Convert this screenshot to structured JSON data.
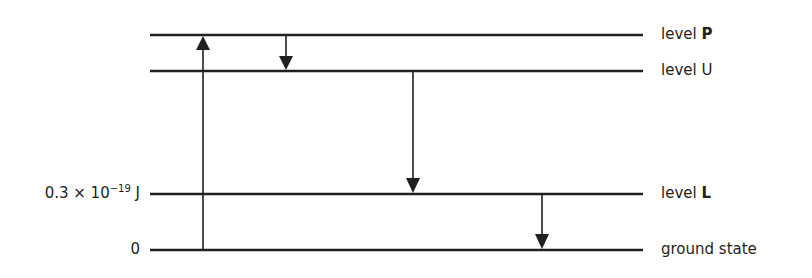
{
  "diagram": {
    "levels": [
      {
        "id": "P",
        "prefix": "level ",
        "name": "P",
        "bold": true,
        "y": 35
      },
      {
        "id": "U",
        "prefix": "level ",
        "name": "U",
        "bold": false,
        "y": 71
      },
      {
        "id": "L",
        "prefix": "level ",
        "name": "L",
        "bold": true,
        "y": 194
      },
      {
        "id": "ground",
        "prefix": "",
        "name": "ground state",
        "bold": false,
        "y": 250
      }
    ],
    "energy_axis": {
      "L_value_mantissa": "0.3 × 10",
      "L_value_exponent": "−19",
      "L_value_unit": " J",
      "ground_value": "0"
    },
    "transitions": [
      {
        "from": "ground",
        "to": "P",
        "direction": "up",
        "x": 203
      },
      {
        "from": "P",
        "to": "U",
        "direction": "down",
        "x": 286
      },
      {
        "from": "U",
        "to": "L",
        "direction": "down",
        "x": 413
      },
      {
        "from": "L",
        "to": "ground",
        "direction": "down",
        "x": 542
      }
    ],
    "line_x_start": 150,
    "line_x_end": 643,
    "color": "#231f20"
  }
}
